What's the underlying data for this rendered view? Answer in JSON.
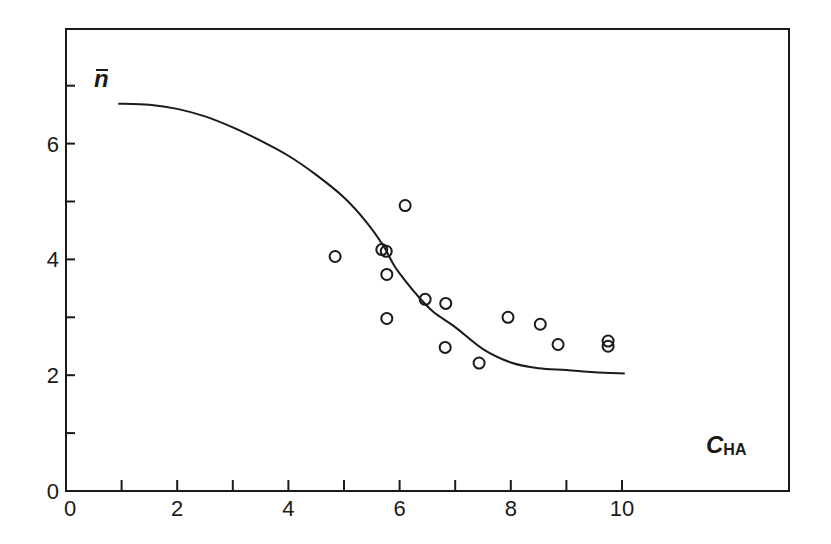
{
  "chart_data": {
    "type": "scatter",
    "title": "",
    "xlabel": "C",
    "xlabel_subscript": "HA",
    "ylabel": "n",
    "ylabel_overbar": true,
    "xlim": [
      0,
      13.4
    ],
    "ylim": [
      0,
      7.95
    ],
    "x_ticks": [
      0,
      1,
      2,
      3,
      4,
      5,
      6,
      7,
      8,
      9,
      10
    ],
    "x_tick_labels": [
      "0",
      "",
      "2",
      "",
      "4",
      "",
      "6",
      "",
      "8",
      "",
      "10"
    ],
    "y_ticks": [
      0,
      1,
      2,
      3,
      4,
      5,
      6,
      7
    ],
    "y_tick_labels": [
      "0",
      "",
      "2",
      "",
      "4",
      "",
      "6",
      ""
    ],
    "grid": false,
    "legend": null,
    "series": [
      {
        "name": "measured",
        "kind": "scatter",
        "marker": "open-circle",
        "points": [
          [
            4.84,
            4.05
          ],
          [
            5.68,
            4.17
          ],
          [
            5.76,
            4.14
          ],
          [
            6.1,
            4.93
          ],
          [
            5.77,
            3.74
          ],
          [
            5.77,
            2.98
          ],
          [
            6.46,
            3.31
          ],
          [
            6.83,
            3.24
          ],
          [
            6.82,
            2.48
          ],
          [
            7.43,
            2.21
          ],
          [
            7.95,
            3.0
          ],
          [
            8.53,
            2.88
          ],
          [
            8.85,
            2.53
          ],
          [
            9.75,
            2.59
          ],
          [
            9.75,
            2.5
          ]
        ]
      },
      {
        "name": "fitted curve",
        "kind": "line",
        "points": [
          [
            0.94,
            6.69
          ],
          [
            1.5,
            6.67
          ],
          [
            2.0,
            6.6
          ],
          [
            2.5,
            6.47
          ],
          [
            3.0,
            6.28
          ],
          [
            3.5,
            6.05
          ],
          [
            4.0,
            5.79
          ],
          [
            4.5,
            5.46
          ],
          [
            5.0,
            5.07
          ],
          [
            5.4,
            4.65
          ],
          [
            5.7,
            4.25
          ],
          [
            5.88,
            3.93
          ],
          [
            6.0,
            3.76
          ],
          [
            6.3,
            3.4
          ],
          [
            6.6,
            3.1
          ],
          [
            7.0,
            2.83
          ],
          [
            7.5,
            2.45
          ],
          [
            8.0,
            2.22
          ],
          [
            8.5,
            2.12
          ],
          [
            9.0,
            2.09
          ],
          [
            9.5,
            2.05
          ],
          [
            10.05,
            2.03
          ]
        ]
      }
    ]
  },
  "axes": {
    "x_title": "C",
    "x_title_sub": "HA",
    "y_title": "n"
  }
}
